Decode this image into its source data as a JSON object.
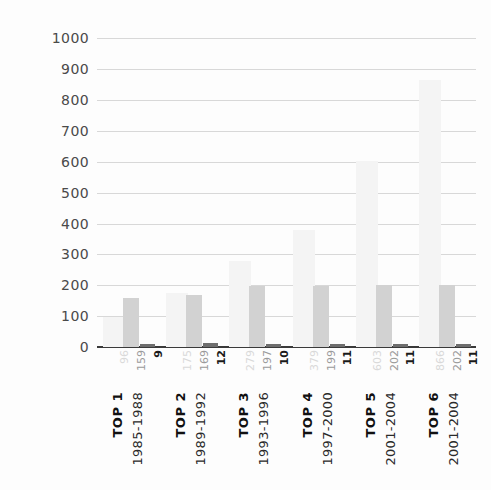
{
  "chart_data": {
    "type": "bar",
    "title": "",
    "subtitle": "",
    "xlabel": "",
    "ylabel": "",
    "ylim": [
      0,
      1050
    ],
    "yticks": [
      0,
      100,
      200,
      300,
      400,
      500,
      600,
      700,
      800,
      900,
      1000
    ],
    "ytick_labels": [
      "0",
      "100",
      "200",
      "300",
      "400",
      "500",
      "600",
      "700",
      "800",
      "900",
      "1000"
    ],
    "grid": true,
    "legend": "none",
    "categories": [
      "TOP 1",
      "TOP 2",
      "TOP 3",
      "TOP 4",
      "TOP 5",
      "TOP 6"
    ],
    "category_periods": [
      "1985-1988",
      "1989-1992",
      "1993-1996",
      "1997-2000",
      "2001-2004",
      "2001-2004"
    ],
    "series": [
      {
        "name": "series-1",
        "color": "#f4f4f4",
        "label_color": "#d9d9d9",
        "values": [
          96,
          175,
          279,
          379,
          603,
          866
        ]
      },
      {
        "name": "series-2",
        "color": "#d2d2d2",
        "label_color": "#9a9a9a",
        "values": [
          159,
          169,
          197,
          199,
          202,
          202
        ]
      },
      {
        "name": "series-3",
        "color": "#6e6e6e",
        "label_color": "#1a1a1a",
        "values": [
          9,
          12,
          10,
          11,
          11,
          11
        ]
      }
    ],
    "colors": {
      "background": "#fdfdfd",
      "gridline": "#d8d8d8",
      "axis": "#3a3a3a",
      "tick_text": "#4a4a4a"
    }
  }
}
